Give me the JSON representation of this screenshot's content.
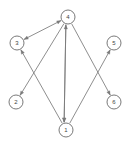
{
  "figure": {
    "background_color": "#ffffff",
    "node_stroke_color": "#6b6b6b",
    "node_fill_color": "#ffffff",
    "edge_color": "#7a7a7a",
    "label_color": "#444444"
  },
  "graph": {
    "directed": true,
    "node_radius": 7,
    "nodes": [
      {
        "id": "4",
        "label": "4",
        "x": 68,
        "y": 17
      },
      {
        "id": "3",
        "label": "3",
        "x": 17,
        "y": 43
      },
      {
        "id": "5",
        "label": "5",
        "x": 114,
        "y": 43
      },
      {
        "id": "2",
        "label": "2",
        "x": 16,
        "y": 102
      },
      {
        "id": "6",
        "label": "6",
        "x": 114,
        "y": 102
      },
      {
        "id": "1",
        "label": "1",
        "x": 66,
        "y": 130
      }
    ],
    "edges": [
      {
        "from": "3",
        "to": "4",
        "bidirectional": true,
        "arrow_at_from": true,
        "arrow_at_to": true
      },
      {
        "from": "1",
        "to": "4",
        "bidirectional": true,
        "arrow_at_from": true,
        "arrow_at_to": true,
        "offset": -2
      },
      {
        "from": "4",
        "to": "1",
        "bidirectional": false,
        "arrow_at_from": false,
        "arrow_at_to": true,
        "offset": 2
      },
      {
        "from": "4",
        "to": "2",
        "bidirectional": false,
        "arrow_at_from": false,
        "arrow_at_to": true
      },
      {
        "from": "4",
        "to": "6",
        "bidirectional": false,
        "arrow_at_from": false,
        "arrow_at_to": true
      },
      {
        "from": "1",
        "to": "3",
        "bidirectional": false,
        "arrow_at_from": false,
        "arrow_at_to": true
      },
      {
        "from": "1",
        "to": "5",
        "bidirectional": false,
        "arrow_at_from": false,
        "arrow_at_to": true
      }
    ]
  }
}
